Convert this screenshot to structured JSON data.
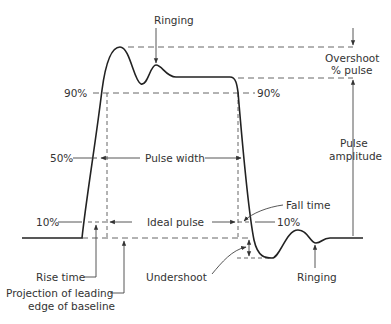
{
  "diagram": {
    "type": "pulse-waveform",
    "labels": {
      "ringing_top": "Ringing",
      "overshoot_line1": "Overshoot",
      "overshoot_line2": "% pulse",
      "pct90_left": "90%",
      "pct90_right": "90%",
      "pct50": "50%",
      "pulse_width": "Pulse width",
      "pulse_amplitude_line1": "Pulse",
      "pulse_amplitude_line2": "amplitude",
      "pct10_left": "10%",
      "ideal_pulse": "Ideal pulse",
      "fall_time": "Fall time",
      "pct10_right": "10%",
      "rise_time": "Rise time",
      "undershoot": "Undershoot",
      "ringing_bottom": "Ringing",
      "projection_line1": "Projection of leading",
      "projection_line2": "edge of baseline"
    }
  }
}
